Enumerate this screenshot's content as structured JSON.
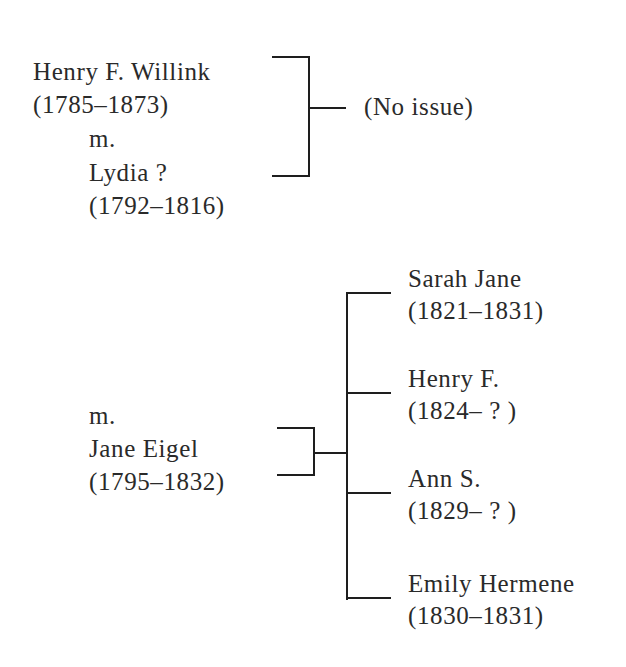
{
  "tree": {
    "first_marriage": {
      "husband": {
        "name": "Henry F. Willink",
        "dates": "(1785–1873)"
      },
      "marriage_label": "m.",
      "wife": {
        "name": "Lydia ?",
        "dates": "(1792–1816)"
      },
      "issue": "(No issue)"
    },
    "second_marriage": {
      "marriage_label": "m.",
      "wife": {
        "name": "Jane Eigel",
        "dates": "(1795–1832)"
      },
      "children": [
        {
          "name": "Sarah Jane",
          "dates": "(1821–1831)"
        },
        {
          "name": "Henry F.",
          "dates": "(1824– ? )"
        },
        {
          "name": "Ann S.",
          "dates": "(1829– ? )"
        },
        {
          "name": "Emily Hermene",
          "dates": "(1830–1831)"
        }
      ]
    }
  },
  "colors": {
    "text": "#2a2a2a",
    "lines": "#1e1e1e",
    "background": "#ffffff"
  }
}
